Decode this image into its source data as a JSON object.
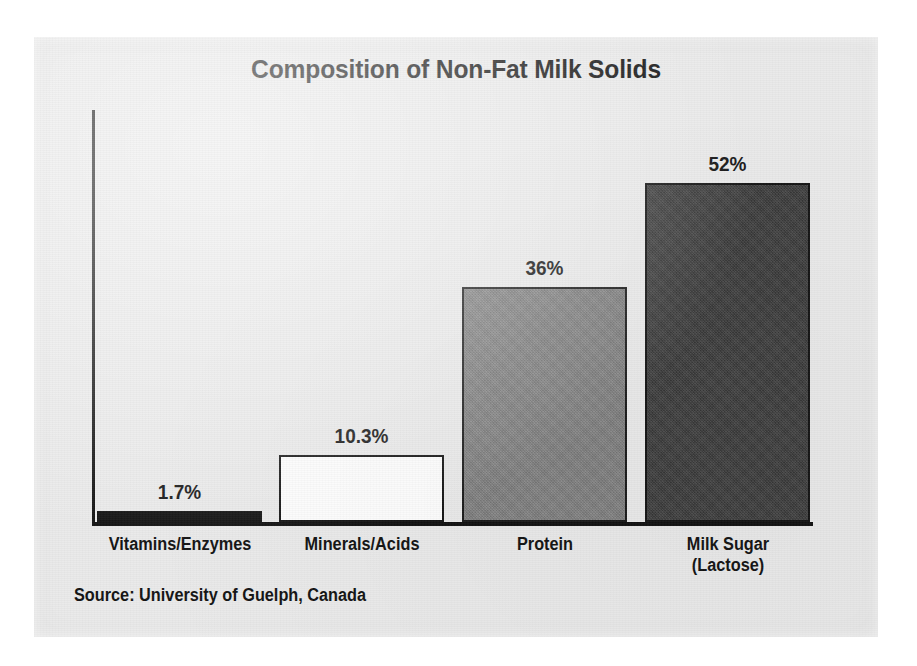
{
  "chart_data": {
    "type": "bar",
    "title": "Composition of Non-Fat Milk Solids",
    "source": "Source: University of Guelph, Canada",
    "xlabel": "",
    "ylabel": "",
    "ylim": [
      0,
      60
    ],
    "grid": false,
    "legend": "none",
    "axis_style": "left spine and baseline only, no tick labels",
    "categories": [
      "Vitamins/Enzymes",
      "Minerals/Acids",
      "Protein",
      "Milk Sugar\n(Lactose)"
    ],
    "values": [
      1.7,
      10.3,
      36,
      52
    ],
    "value_labels": [
      "1.7%",
      "10.3%",
      "36%",
      "52%"
    ],
    "bar_colors": [
      "#111111",
      "#fdfdfd",
      "#808080",
      "#3b3b3b"
    ],
    "bars": [
      {
        "category": "Vitamins/Enzymes",
        "category_line1": "Vitamins/Enzymes",
        "category_line2": "",
        "value": 1.7,
        "label": "1.7%",
        "fill": "#111111",
        "fill_style": "fill-black"
      },
      {
        "category": "Minerals/Acids",
        "category_line1": "Minerals/Acids",
        "category_line2": "",
        "value": 10.3,
        "label": "10.3%",
        "fill": "#fdfdfd",
        "fill_style": "fill-white"
      },
      {
        "category": "Protein",
        "category_line1": "Protein",
        "category_line2": "",
        "value": 36,
        "label": "36%",
        "fill": "#808080",
        "fill_style": "fill-mid"
      },
      {
        "category": "Milk Sugar (Lactose)",
        "category_line1": "Milk Sugar",
        "category_line2": "(Lactose)",
        "value": 52,
        "label": "52%",
        "fill": "#3b3b3b",
        "fill_style": "fill-dark"
      }
    ]
  },
  "page": {
    "background_color": "#ffffff",
    "panel_color": "#eaeaea",
    "text_color": "#121212"
  }
}
